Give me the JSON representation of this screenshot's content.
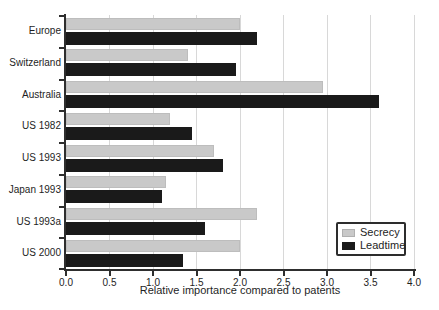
{
  "chart_data": {
    "type": "bar",
    "orientation": "horizontal",
    "title": "",
    "xlabel": "Relative importance compared to patents",
    "ylabel": "",
    "xlim": [
      0,
      4
    ],
    "xticks": [
      "0.0",
      "0.5",
      "1.0",
      "1.5",
      "2.0",
      "2.5",
      "3.0",
      "3.5",
      "4.0"
    ],
    "grid": "vertical",
    "legend_position": "lower-right-inside",
    "categories": [
      "Europe",
      "Switzerland",
      "Australia",
      "US 1982",
      "US 1993",
      "Japan 1993",
      "US 1993a",
      "US 2000"
    ],
    "series": [
      {
        "name": "Secrecy",
        "color": "#c9c9c9",
        "values": [
          2.0,
          1.4,
          2.95,
          1.2,
          1.7,
          1.15,
          2.2,
          2.0
        ]
      },
      {
        "name": "Leadtime",
        "color": "#1a1a1a",
        "values": [
          2.2,
          1.95,
          3.6,
          1.45,
          1.8,
          1.1,
          1.6,
          1.35
        ]
      }
    ]
  },
  "colors": {
    "background": "#ffffff",
    "axis": "#2e2e2e",
    "gridline": "#d8d8d8",
    "text": "#1e1e1e"
  }
}
